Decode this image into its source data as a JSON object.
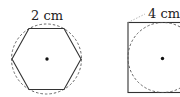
{
  "figures": [
    {
      "shape": "regular-hexagon",
      "label": "2 cm",
      "circumscribed_circle": "dashed",
      "center_dot": true
    },
    {
      "shape": "square",
      "label": "4 cm",
      "inscribed_circle": "dashed",
      "center_dot": true
    }
  ],
  "colors": {
    "stroke": "#333333",
    "dashed": "#555555",
    "text": "#222222"
  }
}
